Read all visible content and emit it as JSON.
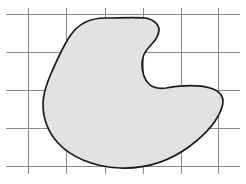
{
  "figure": {
    "title": "",
    "caption": "",
    "background_color": "#ffffff",
    "width": 246,
    "height": 184
  },
  "grid": {
    "label": "coordinate-grid",
    "line_color": "#8a8a8a",
    "line_width": 1,
    "spacing_px": 38,
    "vertical_lines_x": [
      28,
      66,
      105,
      143,
      181,
      218
    ],
    "vertical_extent_y": [
      8,
      174
    ],
    "horizontal_lines_y": [
      14,
      52,
      90,
      128,
      166
    ],
    "horizontal_extent_x": [
      6,
      240
    ]
  },
  "region": {
    "label": "shaded-region",
    "description": "closed freeform blob region",
    "fill_color": "#e2e2e2",
    "stroke_color": "#1a1a1a",
    "stroke_width": 1.7,
    "bounds": {
      "left_x": 43,
      "right_x": 222,
      "top_y": 18,
      "bottom_y": 168
    },
    "path": "M 105 18 C 90 18 78 24 70 36 C 62 48 56 62 50 76 C 45 88 43 97 43 104 C 43 118 48 132 58 143 C 70 156 92 167 120 168 C 146 169 170 161 190 146 C 206 134 218 120 222 107 C 225 98 221 91 210 88 C 196 84 178 86 166 88 C 158 89 153 88 149 84 C 144 79 142 72 142 64 C 142 57 145 51 150 46 C 155 41 159 36 159 30 C 159 24 153 19 145 18 C 134 17 118 18 105 18 Z"
  }
}
